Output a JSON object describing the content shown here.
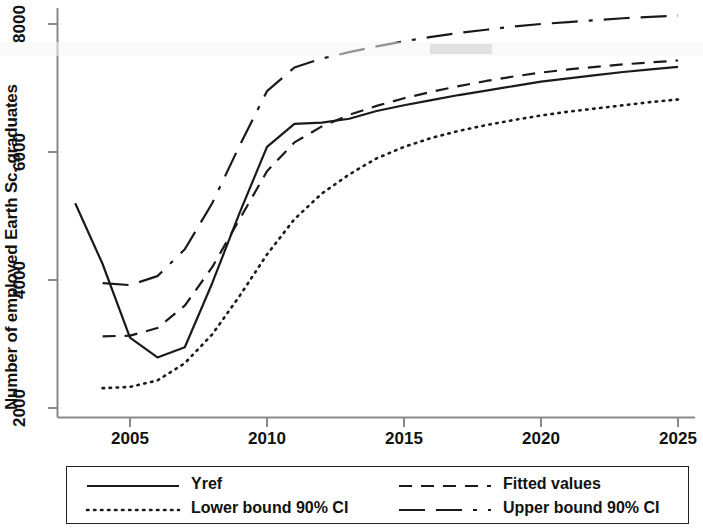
{
  "chart_data": {
    "type": "line",
    "title": "",
    "xlabel": "",
    "ylabel": "Number of employed Earth Sc. graduates",
    "xlim": [
      2003,
      2025
    ],
    "ylim": [
      1700,
      8350
    ],
    "xticks": [
      2005,
      2010,
      2015,
      2020,
      2025
    ],
    "xtick_labels": [
      "2005",
      "2010",
      "2015",
      "2020",
      "2025"
    ],
    "yticks": [
      2000,
      4000,
      6000,
      8000
    ],
    "ytick_labels": [
      "2000",
      "4000",
      "6000",
      "8000"
    ],
    "grid": false,
    "legend_position": "below-axes",
    "series": [
      {
        "name": "Yref",
        "style": "solid",
        "x": [
          2003,
          2004,
          2005,
          2006,
          2007,
          2008,
          2009,
          2010,
          2011,
          2012,
          2013,
          2014,
          2015,
          2016,
          2017,
          2018,
          2019,
          2020,
          2021,
          2022,
          2023,
          2024,
          2025
        ],
        "y": [
          5200,
          4250,
          3100,
          2790,
          2950,
          3950,
          5050,
          6080,
          6440,
          6460,
          6520,
          6640,
          6730,
          6810,
          6890,
          6960,
          7030,
          7100,
          7150,
          7200,
          7250,
          7290,
          7330
        ]
      },
      {
        "name": "Fitted values",
        "style": "dashed",
        "x": [
          2004,
          2005,
          2006,
          2007,
          2008,
          2009,
          2010,
          2011,
          2012,
          2013,
          2014,
          2015,
          2016,
          2017,
          2018,
          2019,
          2020,
          2021,
          2022,
          2023,
          2024,
          2025
        ],
        "y": [
          3120,
          3130,
          3250,
          3600,
          4200,
          4950,
          5700,
          6150,
          6400,
          6580,
          6720,
          6840,
          6940,
          7030,
          7110,
          7180,
          7240,
          7290,
          7330,
          7370,
          7400,
          7430
        ]
      },
      {
        "name": "Lower bound 90% CI",
        "style": "dotted",
        "x": [
          2004,
          2005,
          2006,
          2007,
          2008,
          2009,
          2010,
          2011,
          2012,
          2013,
          2014,
          2015,
          2016,
          2017,
          2018,
          2019,
          2020,
          2021,
          2022,
          2023,
          2024,
          2025
        ],
        "y": [
          2310,
          2330,
          2430,
          2700,
          3150,
          3750,
          4400,
          4950,
          5350,
          5650,
          5900,
          6080,
          6220,
          6330,
          6420,
          6500,
          6570,
          6630,
          6680,
          6730,
          6780,
          6820
        ]
      },
      {
        "name": "Upper bound 90% CI",
        "style": "longdash",
        "x": [
          2004,
          2005,
          2006,
          2007,
          2008,
          2009,
          2010,
          2011,
          2012,
          2013,
          2014,
          2015,
          2016,
          2017,
          2018,
          2019,
          2020,
          2021,
          2022,
          2023,
          2024,
          2025
        ],
        "y": [
          3950,
          3920,
          4060,
          4480,
          5200,
          6100,
          6950,
          7320,
          7460,
          7560,
          7650,
          7730,
          7800,
          7860,
          7910,
          7960,
          8000,
          8030,
          8060,
          8090,
          8110,
          8130
        ]
      }
    ]
  },
  "axes": {
    "y_title": "Number of employed Earth Sc. graduates"
  },
  "legend": {
    "entries": [
      {
        "label": "Yref",
        "style": "solid"
      },
      {
        "label": "Fitted values",
        "style": "dashed"
      },
      {
        "label": "Lower bound 90% CI",
        "style": "dotted"
      },
      {
        "label": "Upper bound 90% CI",
        "style": "longdash"
      }
    ]
  }
}
